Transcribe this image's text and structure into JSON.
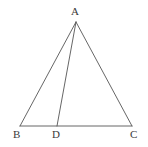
{
  "figure": {
    "kind": "geometry-diagram",
    "canvas": {
      "width": 148,
      "height": 147,
      "background": "#ffffff"
    },
    "stroke": {
      "color": "#555555",
      "width": 0.9
    },
    "label_color": "#3a3a3a",
    "points": [
      {
        "id": "A",
        "label": "A",
        "x": 76,
        "y": 22,
        "label_x": 71,
        "label_y": 6
      },
      {
        "id": "B",
        "label": "B",
        "x": 20,
        "y": 126,
        "label_x": 13,
        "label_y": 129
      },
      {
        "id": "D",
        "label": "D",
        "x": 57,
        "y": 126,
        "label_x": 52,
        "label_y": 129
      },
      {
        "id": "C",
        "label": "C",
        "x": 132,
        "y": 126,
        "label_x": 130,
        "label_y": 129
      }
    ],
    "segments": [
      {
        "id": "AB",
        "from": "A",
        "to": "B",
        "name": "side-ab"
      },
      {
        "id": "AC",
        "from": "A",
        "to": "C",
        "name": "side-ac"
      },
      {
        "id": "BC",
        "from": "B",
        "to": "C",
        "name": "side-bc"
      },
      {
        "id": "AD",
        "from": "A",
        "to": "D",
        "name": "cevian-ad"
      }
    ]
  }
}
